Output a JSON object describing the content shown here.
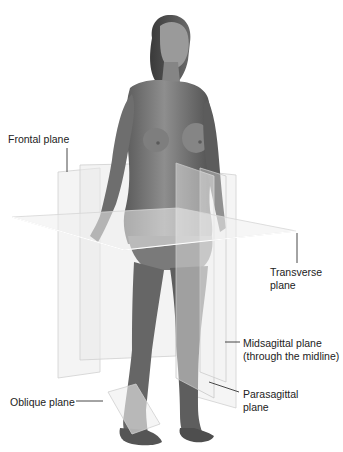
{
  "labels": {
    "frontal": "Frontal plane",
    "transverse_1": "Transverse",
    "transverse_2": "plane",
    "midsagittal_1": "Midsagittal plane",
    "midsagittal_2": "(through the midline)",
    "parasagittal_1": "Parasagittal",
    "parasagittal_2": "plane",
    "oblique": "Oblique plane"
  },
  "colors": {
    "background": "#ffffff",
    "plane_fill": "#e8e8e8",
    "plane_edge": "#c8c8c8",
    "figure_skin": "#8a8a8a",
    "figure_shadow": "#5e5e5e",
    "leader_line": "#333333",
    "text": "#222222"
  }
}
